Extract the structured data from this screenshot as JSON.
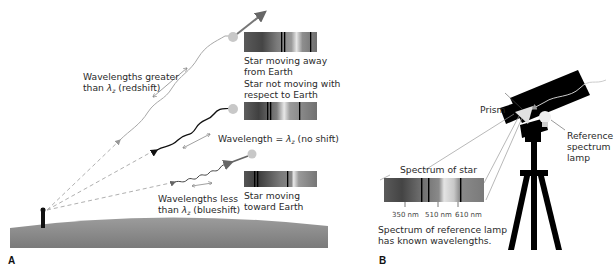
{
  "panel_a": {
    "label": "A",
    "redshift_label_line1": "Wavelengths greater",
    "redshift_label_line2_prefix": "than ",
    "redshift_label_line2_suffix": " (redshift)",
    "noshift_label_prefix": "Wavelength = ",
    "noshift_label_suffix": " (no shift)",
    "blueshift_label_line1": "Wavelengths less",
    "blueshift_label_line2_prefix": "than ",
    "blueshift_label_line2_suffix": " (blueshift)",
    "lambda_symbol": "λ",
    "lambda_subscript": "z",
    "star_away_line1": "Star moving away",
    "star_away_line2": "from Earth",
    "star_still_line1": "Star not moving with",
    "star_still_line2": "respect to Earth",
    "star_toward_line1": "Star moving",
    "star_toward_line2": "toward Earth"
  },
  "panel_b": {
    "label": "B",
    "prism_label": "Prism",
    "lamp_label_line1": "Reference",
    "lamp_label_line2": "spectrum",
    "lamp_label_line3": "lamp",
    "spectrum_of_star_label": "Spectrum of star",
    "wavelength_ticks": [
      "350 nm",
      "510 nm",
      "610 nm"
    ],
    "caption_line1": "Spectrum of reference lamp",
    "caption_line2": "has known wavelengths."
  },
  "colors": {
    "ground": "#8a8a8a",
    "star": "#c8c8c8",
    "light_path": "#9a9a9a",
    "telescope": "#000000",
    "spectrum_dark": "#555555",
    "spectrum_light": "#e8e8e8"
  }
}
